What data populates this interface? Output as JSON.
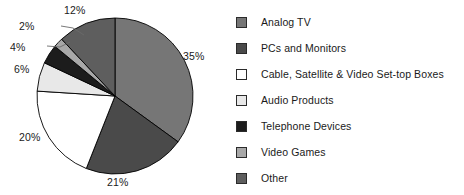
{
  "chart_data": {
    "type": "pie",
    "title": "",
    "labels": [
      "Analog TV",
      "PCs and Monitors",
      "Cable, Satellite & Video Set-top Boxes",
      "Audio Products",
      "Telephone Devices",
      "Video Games",
      "Other"
    ],
    "values": [
      35,
      21,
      20,
      6,
      4,
      2,
      12
    ],
    "value_labels": [
      "35%",
      "21%",
      "20%",
      "6%",
      "4%",
      "2%",
      "12%"
    ],
    "colors": [
      "#767676",
      "#4a4a4a",
      "#ffffff",
      "#e8e8e8",
      "#1c1c1c",
      "#a8a8a8",
      "#5e5e5e"
    ],
    "legend_position": "right",
    "start_angle_deg": 0,
    "direction": "clockwise",
    "grid": false,
    "units": "percent"
  },
  "pie": {
    "slices": [
      {
        "name": "analog-tv",
        "label": "Analog TV",
        "percent_label": "35%",
        "value": 35,
        "color": "#767676",
        "label_x": 183,
        "label_y": 50
      },
      {
        "name": "pcs-and-monitors",
        "label": "PCs and Monitors",
        "percent_label": "21%",
        "value": 21,
        "color": "#4a4a4a",
        "label_x": 107,
        "label_y": 176
      },
      {
        "name": "cable-satellite-settop",
        "label": "Cable, Satellite & Video Set-top Boxes",
        "percent_label": "20%",
        "value": 20,
        "color": "#ffffff",
        "label_x": 19,
        "label_y": 131
      },
      {
        "name": "audio-products",
        "label": "Audio Products",
        "percent_label": "6%",
        "value": 6,
        "color": "#e8e8e8",
        "label_x": 14,
        "label_y": 63
      },
      {
        "name": "telephone-devices",
        "label": "Telephone Devices",
        "percent_label": "4%",
        "value": 4,
        "color": "#1c1c1c",
        "label_x": 10,
        "label_y": 41
      },
      {
        "name": "video-games",
        "label": "Video Games",
        "percent_label": "2%",
        "value": 2,
        "color": "#a8a8a8",
        "label_x": 19,
        "label_y": 20
      },
      {
        "name": "other",
        "label": "Other",
        "percent_label": "12%",
        "value": 12,
        "color": "#5e5e5e",
        "label_x": 64,
        "label_y": 4
      }
    ],
    "geometry": {
      "center_x": 115,
      "center_y": 96,
      "radius": 78
    },
    "outline_color": "#000000"
  },
  "legend": {
    "items": [
      {
        "label": "Analog TV",
        "color": "#767676",
        "name": "analog-tv"
      },
      {
        "label": "PCs and Monitors",
        "color": "#4a4a4a",
        "name": "pcs-and-monitors"
      },
      {
        "label": "Cable, Satellite & Video Set-top Boxes",
        "color": "#ffffff",
        "name": "cable-satellite-settop"
      },
      {
        "label": "Audio Products",
        "color": "#e8e8e8",
        "name": "audio-products"
      },
      {
        "label": "Telephone Devices",
        "color": "#1c1c1c",
        "name": "telephone-devices"
      },
      {
        "label": "Video Games",
        "color": "#a8a8a8",
        "name": "video-games"
      },
      {
        "label": "Other",
        "color": "#5e5e5e",
        "name": "other"
      }
    ]
  }
}
